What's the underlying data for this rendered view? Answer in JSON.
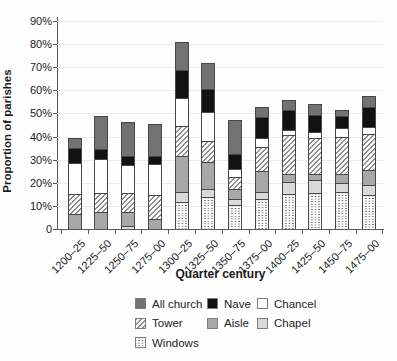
{
  "chart_data": {
    "type": "stacked-bar",
    "title": "",
    "xlabel": "Quarter century",
    "ylabel": "Proportion of parishes",
    "ylim": [
      0,
      90
    ],
    "ytick_step": 10,
    "yticks": [
      "0",
      "10%",
      "20%",
      "30%",
      "40%",
      "50%",
      "60%",
      "70%",
      "80%",
      "90%"
    ],
    "grid": "horizontal light-gray lines at each 10%",
    "legend_position": "below-chart",
    "categories": [
      "1200–25",
      "1225–50",
      "1250–75",
      "1275–00",
      "1300–25",
      "1325–50",
      "1350–75",
      "1375–00",
      "1400–25",
      "1425–50",
      "1450–75",
      "1475–00"
    ],
    "series": [
      {
        "name": "Windows",
        "style": "windows",
        "values": [
          0,
          0,
          0,
          0,
          11.5,
          14,
          10.5,
          13,
          15,
          15.5,
          16,
          14.5
        ]
      },
      {
        "name": "Chapel",
        "style": "chapel",
        "values": [
          0,
          0,
          1.5,
          0,
          4.5,
          3.5,
          2.5,
          3,
          5.5,
          5.5,
          4,
          4.5
        ]
      },
      {
        "name": "Aisle",
        "style": "aisle",
        "values": [
          6.5,
          7.5,
          6,
          4.5,
          15.5,
          11.5,
          4.5,
          9,
          3.5,
          3,
          4,
          6.5
        ]
      },
      {
        "name": "Tower",
        "style": "tower",
        "values": [
          8.5,
          8,
          8,
          10,
          13,
          9,
          5,
          10.5,
          16.5,
          15.5,
          16,
          15.5
        ]
      },
      {
        "name": "Chancel",
        "style": "chancel",
        "values": [
          13.5,
          15,
          12,
          13.5,
          12,
          12.5,
          3.5,
          4,
          2.5,
          2.5,
          3.5,
          3
        ]
      },
      {
        "name": "Nave",
        "style": "nave",
        "values": [
          6.5,
          4,
          4,
          3.5,
          12.5,
          10,
          6.5,
          9,
          8.5,
          7.5,
          5.5,
          9
        ]
      },
      {
        "name": "All church",
        "style": "allchurch",
        "values": [
          4.5,
          14.5,
          15,
          14,
          12,
          11.5,
          14.5,
          4.5,
          4.5,
          4.5,
          2.5,
          4.5
        ]
      }
    ],
    "totals": [
      39.5,
      49,
      46.5,
      45.5,
      81,
      72,
      47,
      53,
      56,
      54,
      51.5,
      57.5
    ],
    "legend": [
      {
        "label": "All church",
        "style": "allchurch"
      },
      {
        "label": "Nave",
        "style": "nave"
      },
      {
        "label": "Chancel",
        "style": "chancel"
      },
      {
        "label": "Tower",
        "style": "tower"
      },
      {
        "label": "Aisle",
        "style": "aisle"
      },
      {
        "label": "Chapel",
        "style": "chapel"
      },
      {
        "label": "Windows",
        "style": "windows"
      }
    ],
    "colors": {
      "allchurch": "#727272",
      "nave": "#121212",
      "chancel": "#ffffff",
      "aisle": "#a8a8a8",
      "chapel": "#d9d9d9",
      "tower": "white with gray diagonal hatch",
      "windows": "white with gray dotted grid",
      "segment_border": "#474747",
      "axis": "#5a5a5a",
      "gridline": "#ebebeb",
      "text": "#1a1a1a"
    }
  }
}
